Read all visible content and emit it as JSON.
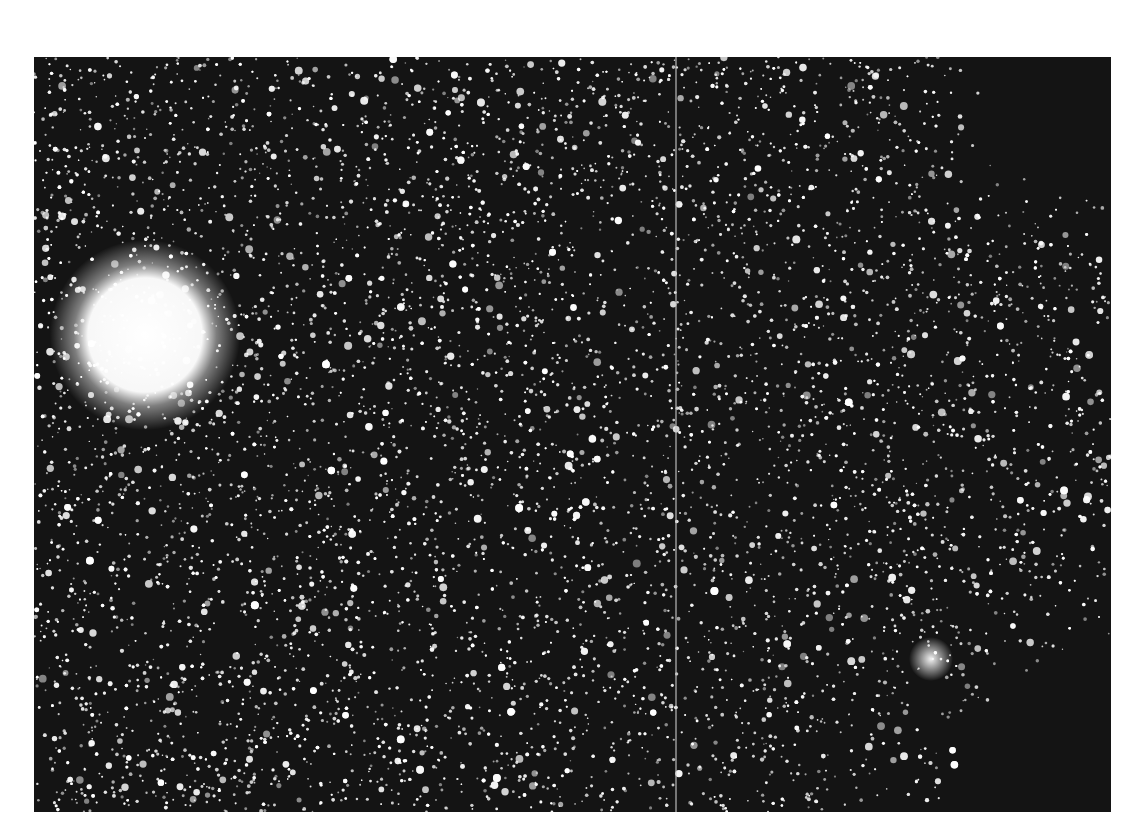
{
  "image": {
    "subject": "Dense star field photograph",
    "description": "Black-and-white astronomical plate showing a dense field of stars with a bright saturated glow at left and a darker, sparser region toward the upper and lower right corners; a thin vertical seam divides two exposures.",
    "plate": {
      "x": 34,
      "y": 57,
      "width": 1077,
      "height": 755
    },
    "background_color": "#141414",
    "page_color": "#ffffff",
    "star_color": "#ffffff",
    "bright_source": {
      "cx": 111,
      "cy": 278,
      "radius": 68
    },
    "secondary_cluster": {
      "cx": 897,
      "cy": 602,
      "radius": 22
    },
    "seam_x": 642,
    "dark_regions": [
      {
        "corner": "top-right",
        "cx": 1077,
        "cy": 0,
        "radius": 230
      },
      {
        "corner": "bottom-right",
        "cx": 1077,
        "cy": 755,
        "radius": 260
      }
    ],
    "star_count": 9000
  }
}
